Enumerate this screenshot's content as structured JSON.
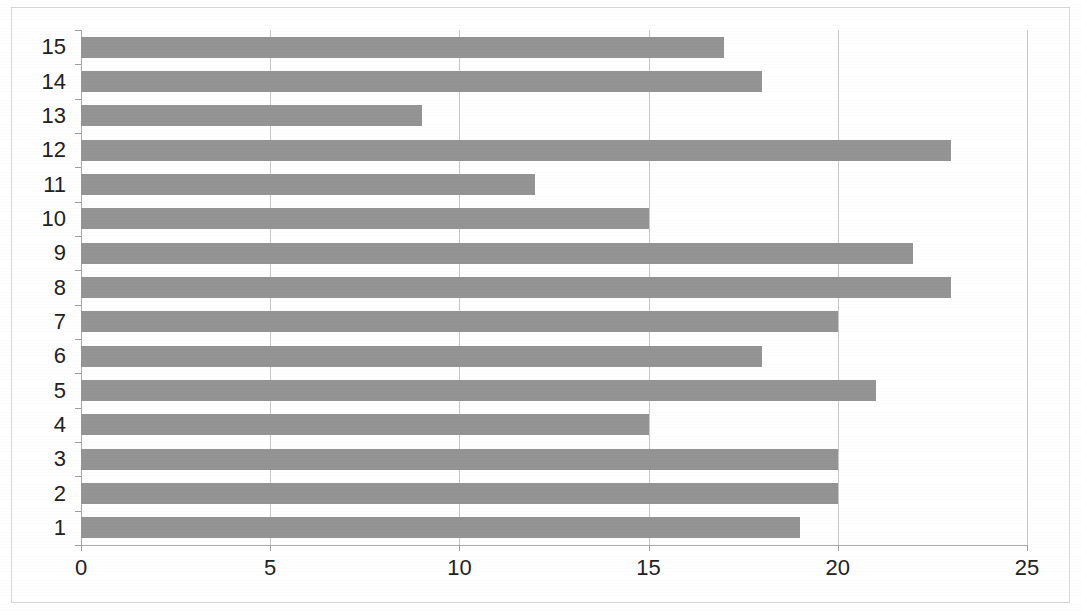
{
  "chart_data": {
    "type": "bar",
    "orientation": "horizontal",
    "title": "",
    "xlabel": "",
    "ylabel": "",
    "categories": [
      "1",
      "2",
      "3",
      "4",
      "5",
      "6",
      "7",
      "8",
      "9",
      "10",
      "11",
      "12",
      "13",
      "14",
      "15"
    ],
    "values": [
      19,
      20,
      20,
      15,
      21,
      18,
      20,
      23,
      22,
      15,
      12,
      23,
      9,
      18,
      17
    ],
    "xlim": [
      0,
      25
    ],
    "xticks": [
      0,
      5,
      10,
      15,
      20,
      25
    ],
    "xtick_labels": [
      "0",
      "5",
      "10",
      "15",
      "20",
      "25"
    ],
    "ytick_labels": [
      "15",
      "14",
      "13",
      "12",
      "11",
      "10",
      "9",
      "8",
      "7",
      "6",
      "5",
      "4",
      "3",
      "2",
      "1"
    ],
    "grid": "vertical",
    "legend": "none",
    "bar_color": "#949494",
    "gridline_color": "#c8c8c8",
    "axis_color": "#aaaaaa",
    "background_color": "#ffffff"
  },
  "figure": {
    "border_color": "#d7d7d7",
    "title_remnant": ""
  }
}
